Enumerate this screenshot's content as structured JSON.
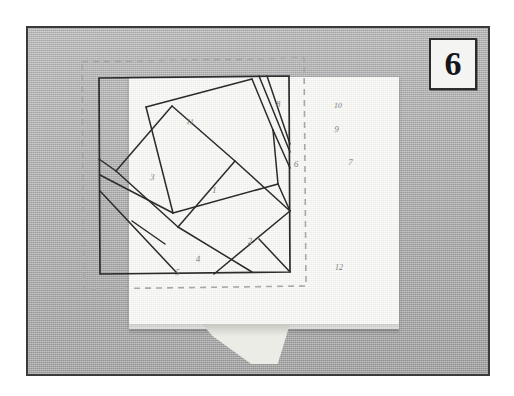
{
  "figure": {
    "step_number": "6",
    "caption": ""
  },
  "colors": {
    "photo_border": "#3a3a3a",
    "background_gray": "#b4b4b4",
    "fabric_white": "#f2f2ee",
    "ink_line": "#2b2b2b",
    "stitch_dash": "#a9a9a9",
    "number_ink": "#7c7c7c",
    "badge_ink": "#14161a"
  },
  "block": {
    "title": "",
    "outline_label": "drawn-block-square",
    "stitch_line_label": "basting-stitch-dashed-outline",
    "piece_numbers": [
      {
        "id": "1",
        "label": "1",
        "x": 212,
        "y": 193,
        "note": "center piece"
      },
      {
        "id": "2",
        "label": "2",
        "x": 248,
        "y": 244,
        "note": "lower center"
      },
      {
        "id": "3",
        "label": "3",
        "x": 150,
        "y": 180,
        "note": "left side"
      },
      {
        "id": "4",
        "label": "4",
        "x": 196,
        "y": 262,
        "note": "lower left narrow"
      },
      {
        "id": "5",
        "label": "5",
        "x": 175,
        "y": 275,
        "note": "bottom left corner"
      },
      {
        "id": "6",
        "label": "6",
        "x": 294,
        "y": 167,
        "note": "upper right"
      },
      {
        "id": "7",
        "label": "7",
        "x": 348,
        "y": 165,
        "note": "right sliver"
      },
      {
        "id": "8",
        "label": "8",
        "x": 276,
        "y": 107,
        "note": "top center"
      },
      {
        "id": "9",
        "label": "9",
        "x": 334,
        "y": 132,
        "note": "narrow upper right sliver"
      },
      {
        "id": "10",
        "label": "10",
        "x": 334,
        "y": 108,
        "note": "top right corner"
      },
      {
        "id": "11",
        "label": "11",
        "x": 186,
        "y": 124,
        "note": "top left corner"
      },
      {
        "id": "12",
        "label": "12",
        "x": 335,
        "y": 270,
        "note": "bottom right corner"
      }
    ]
  },
  "geometry": {
    "photo_frame": {
      "x": 26,
      "y": 26,
      "w": 464,
      "h": 350
    },
    "fabric": {
      "x": 101,
      "y": 49,
      "w": 270,
      "h": 252
    },
    "drawn_square": {
      "x": 167,
      "y": 96,
      "w": 188,
      "h": 194
    },
    "stitch_rect": {
      "x": 152,
      "y": 80,
      "w": 220,
      "h": 224
    }
  }
}
